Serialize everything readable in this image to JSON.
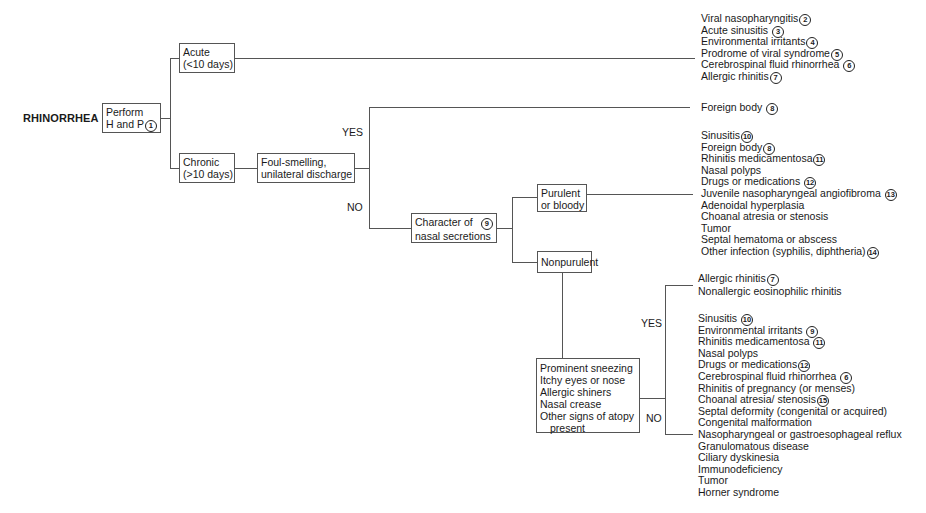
{
  "title": "RHINORRHEA",
  "nodes": {
    "perform": {
      "line1": "Perform",
      "line2": "H and P",
      "note": "1"
    },
    "acute": {
      "line1": "Acute",
      "line2": "(<10 days)"
    },
    "chronic": {
      "line1": "Chronic",
      "line2": "(>10 days)"
    },
    "foul": {
      "line1": "Foul-smelling,",
      "line2": "unilateral discharge"
    },
    "character": {
      "line1": "Character of",
      "line2": "nasal secretions",
      "note": "9"
    },
    "purulent": {
      "line1": "Purulent",
      "line2": "or bloody"
    },
    "nonpurulent": {
      "line1": "Nonpurulent"
    },
    "atopy": {
      "lines": [
        "Prominent sneezing",
        "Itchy eyes or nose",
        "Allergic shiners",
        "Nasal crease",
        "Other signs of atopy",
        "present"
      ]
    }
  },
  "branch_labels": {
    "foul_yes": "YES",
    "foul_no": "NO",
    "atopy_yes": "YES",
    "atopy_no": "NO"
  },
  "outcomes": {
    "acute": [
      {
        "text": "Viral nasopharyngitis",
        "note": "2"
      },
      {
        "text": "Acute sinusitis ",
        "note": "3"
      },
      {
        "text": "Environmental irritants",
        "note": "4"
      },
      {
        "text": "Prodrome of viral syndrome",
        "note": "5"
      },
      {
        "text": "Cerebrospinal fluid rhinorrhea ",
        "note": "6"
      },
      {
        "text": "Allergic rhinitis",
        "note": "7"
      }
    ],
    "foreign_body": [
      {
        "text": "Foreign body ",
        "note": "8"
      }
    ],
    "purulent": [
      {
        "text": "Sinusitis",
        "note": "10"
      },
      {
        "text": "Foreign body",
        "note": "8"
      },
      {
        "text": "Rhinitis medicamentosa",
        "note": "11"
      },
      {
        "text": "Nasal polyps"
      },
      {
        "text": "Drugs or medications ",
        "note": "12"
      },
      {
        "text": "Juvenile nasopharyngeal angiofibroma ",
        "note": "13"
      },
      {
        "text": "Adenoidal hyperplasia"
      },
      {
        "text": "Choanal atresia or stenosis"
      },
      {
        "text": "Tumor"
      },
      {
        "text": "Septal hematoma or abscess"
      },
      {
        "text": "Other infection (syphilis, diphtheria)",
        "note": "14"
      }
    ],
    "atopy_yes": [
      {
        "text": "Allergic rhinitis",
        "note": "7"
      },
      {
        "text": "Nonallergic eosinophilic rhinitis"
      }
    ],
    "atopy_no": [
      {
        "text": "Sinusitis ",
        "note": "10"
      },
      {
        "text": "Environmental irritants ",
        "note": "9"
      },
      {
        "text": "Rhinitis medicamentosa ",
        "note": "11"
      },
      {
        "text": "Nasal polyps"
      },
      {
        "text": "Drugs or medications",
        "note": "12"
      },
      {
        "text": "Cerebrospinal fluid rhinorrhea ",
        "note": "6"
      },
      {
        "text": "Rhinitis of pregnancy (or menses)"
      },
      {
        "text": "Choanal atresia/ stenosis",
        "note": "15"
      },
      {
        "text": "Septal deformity (congenital or acquired)"
      },
      {
        "text": "Congenital malformation"
      },
      {
        "text": "Nasopharyngeal or gastroesophageal reflux"
      },
      {
        "text": "Granulomatous disease"
      },
      {
        "text": "Ciliary dyskinesia"
      },
      {
        "text": "Immunodeficiency"
      },
      {
        "text": "Tumor"
      },
      {
        "text": "Horner syndrome"
      }
    ]
  }
}
